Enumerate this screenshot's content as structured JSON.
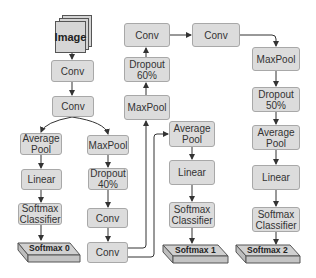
{
  "diagram": {
    "input": {
      "label": "Image"
    },
    "trunk": [
      {
        "id": "conv1",
        "label": "Conv"
      },
      {
        "id": "conv2",
        "label": "Conv"
      }
    ],
    "branch0": {
      "average_pool": "Average\nPool",
      "linear": "Linear",
      "classifier": "Softmax\nClassifier",
      "output": "Softmax 0"
    },
    "middle_column": {
      "maxpool": "MaxPool",
      "dropout": "Dropout\n40%",
      "conv_a": "Conv",
      "conv_b": "Conv"
    },
    "upper_column": {
      "maxpool": "MaxPool",
      "dropout": "Dropout\n60%",
      "conv": "Conv"
    },
    "top_right": {
      "conv": "Conv"
    },
    "branch1": {
      "average_pool": "Average\nPool",
      "linear": "Linear",
      "classifier": "Softmax\nClassifier",
      "output": "Softmax 1"
    },
    "branch2": {
      "maxpool": "MaxPool",
      "dropout": "Dropout\n50%",
      "average_pool": "Average\nPool",
      "linear": "Linear",
      "classifier": "Softmax\nClassifier",
      "output": "Softmax 2"
    }
  },
  "colors": {
    "node_fill": "#dcdcdc",
    "node_border": "#a8a8a8",
    "edge": "#333333",
    "text": "#333333"
  }
}
